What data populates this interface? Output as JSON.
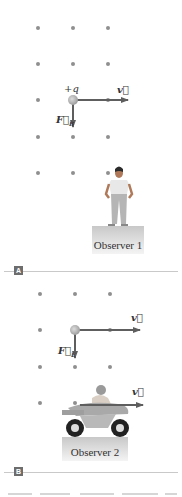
{
  "panels": [
    {
      "tag": "A",
      "charge_label": "+q",
      "velocity_label": "v⃗",
      "force_label": "F⃗",
      "force_subscript": "B",
      "observer_label": "Observer 1",
      "observer": "standing-person"
    },
    {
      "tag": "B",
      "velocity_label": "v⃗",
      "velocity_label_2": "v⃗",
      "force_label": "F⃗",
      "force_subscript": "E",
      "observer_label": "Observer 2",
      "observer": "motorcycle-rider"
    }
  ],
  "colors": {
    "dot": "#8f8f8f",
    "arrow": "#5e5e5e",
    "charge": "#b8b8b8",
    "pedestal_top": "#f0f0f0",
    "pedestal_bottom": "#c8c8c8",
    "tag_bg": "#6d6d6d",
    "rule": "#c9c9c9"
  }
}
